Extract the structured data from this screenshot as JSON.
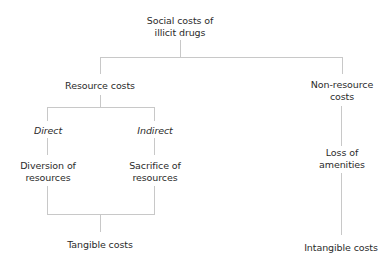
{
  "diagram": {
    "type": "tree",
    "root": {
      "label_line1": "Social costs of",
      "label_line2": "illicit drugs"
    },
    "resource": {
      "label": "Resource costs"
    },
    "non_resource": {
      "label_line1": "Non-resource",
      "label_line2": "costs"
    },
    "direct": {
      "label": "Direct"
    },
    "indirect": {
      "label": "Indirect"
    },
    "diversion": {
      "label_line1": "Diversion of",
      "label_line2": "resources"
    },
    "sacrifice": {
      "label_line1": "Sacrifice of",
      "label_line2": "resources"
    },
    "amenities": {
      "label_line1": "Loss of",
      "label_line2": "amenities"
    },
    "tangible": {
      "label": "Tangible costs"
    },
    "intangible": {
      "label": "Intangible costs"
    },
    "line_color": "#c8c8c8"
  }
}
